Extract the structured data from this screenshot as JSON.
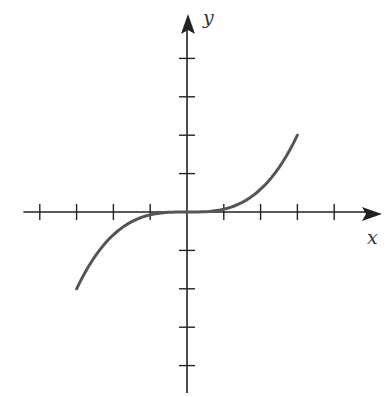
{
  "chart_data": {
    "type": "line",
    "title": "",
    "xlabel": "x",
    "ylabel": "y",
    "function": "y = (2/27) x^3",
    "xlim": [
      -4.5,
      5
    ],
    "ylim": [
      -4.8,
      4.5
    ],
    "x_ticks": [
      -4,
      -3,
      -2,
      -1,
      1,
      2,
      3,
      4
    ],
    "y_ticks": [
      -4,
      -3,
      -2,
      -1,
      1,
      2,
      3,
      4
    ],
    "tick_labels_shown": false,
    "grid": false,
    "legend": null,
    "series": [
      {
        "name": "cubic curve",
        "x": [
          -3,
          -2.5,
          -2,
          -1.5,
          -1,
          -0.5,
          0,
          0.5,
          1,
          1.5,
          2,
          2.5,
          3
        ],
        "values": [
          -2,
          -1.157,
          -0.593,
          -0.25,
          -0.074,
          -0.009,
          0,
          0.009,
          0.074,
          0.25,
          0.593,
          1.157,
          2
        ]
      }
    ],
    "colors": {
      "axis": "#222222",
      "curve": "#555555"
    }
  },
  "labels": {
    "x": "x",
    "y": "y"
  }
}
